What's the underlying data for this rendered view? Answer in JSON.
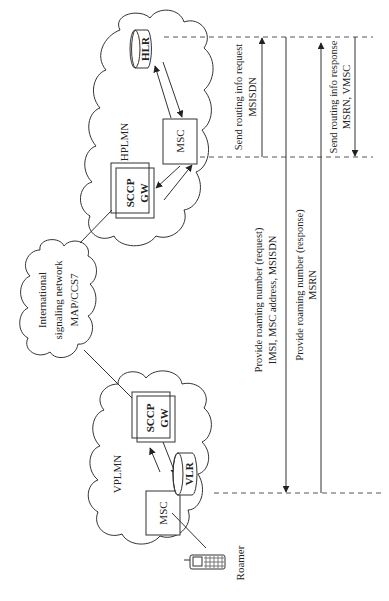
{
  "diagram": {
    "networks": {
      "hplmn": {
        "label": "HPLMN"
      },
      "vplmn": {
        "label": "VPLMN"
      },
      "international": {
        "line1": "International",
        "line2": "signaling network",
        "line3": "MAP/CCS7"
      }
    },
    "nodes": {
      "hlr": "HLR",
      "hplmn_msc": "MSC",
      "hplmn_gw_line1": "SCCP",
      "hplmn_gw_line2": "GW",
      "vplmn_gw_line1": "SCCP",
      "vplmn_gw_line2": "GW",
      "vlr": "VLR",
      "vplmn_msc": "MSC",
      "roamer": "Roamer"
    },
    "messages": [
      {
        "line1": "Send routing info request",
        "line2": "MSISDN",
        "direction": "up"
      },
      {
        "line1": "Provide roaming number (request)",
        "line2": "IMSI, MSC address, MSISDN",
        "direction": "down"
      },
      {
        "line1": "Provide roaming number (response)",
        "line2": "MSRN",
        "direction": "up"
      },
      {
        "line1": "Send routing info response",
        "line2": "MSRN, VMSC",
        "direction": "down"
      }
    ],
    "colors": {
      "line": "#333333",
      "dash": "#555555",
      "background": "#ffffff"
    }
  }
}
